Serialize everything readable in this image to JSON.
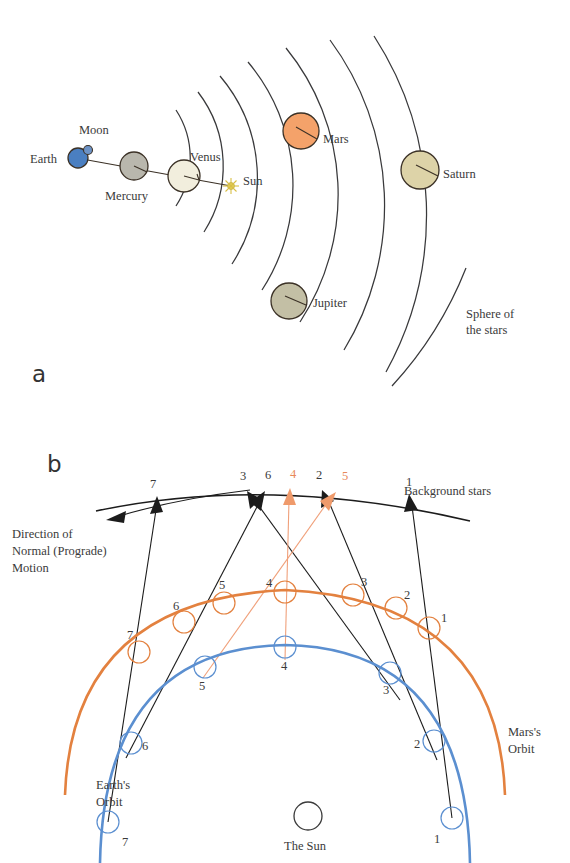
{
  "figure": {
    "panels": [
      {
        "letter": "a",
        "caption_x": 32,
        "caption_y": 382
      },
      {
        "letter": "b",
        "caption_x": 47,
        "caption_y": 464
      }
    ]
  },
  "panel_a": {
    "title_hidden": "Geocentric (Ptolemaic) arrangement",
    "bodies": [
      {
        "name": "Earth",
        "label": "Earth",
        "color": "#4a7fc1",
        "r": 10,
        "cx": 78,
        "cy": 158,
        "label_x": 30,
        "label_y": 162,
        "anchor": "start"
      },
      {
        "name": "Moon",
        "label": "Moon",
        "color": "#6d93c6",
        "r": 4,
        "cx": 88,
        "cy": 150,
        "label_x": 79,
        "label_y": 133,
        "anchor": "start"
      },
      {
        "name": "Mercury",
        "label": "Mercury",
        "color": "#b9b7ad",
        "r": 14,
        "cx": 134,
        "cy": 166,
        "label_x": 105,
        "label_y": 200,
        "anchor": "start"
      },
      {
        "name": "Venus",
        "label": "Venus",
        "color": "#f2eedd",
        "r": 16,
        "cx": 184,
        "cy": 176,
        "label_x": 190,
        "label_y": 161,
        "anchor": "start"
      },
      {
        "name": "Sun",
        "label": "Sun",
        "color": "#f2e06a",
        "r": 4,
        "cx": 231,
        "cy": 186,
        "label_x": 243,
        "label_y": 184,
        "anchor": "start"
      },
      {
        "name": "Mars",
        "label": "Mars",
        "color": "#f4a26a",
        "r": 18,
        "cx": 301,
        "cy": 131,
        "label_x": 323,
        "label_y": 142,
        "anchor": "start"
      },
      {
        "name": "Jupiter",
        "label": "Jupiter",
        "color": "#c3bfa5",
        "r": 18,
        "cx": 289,
        "cy": 301,
        "label_x": 312,
        "label_y": 306,
        "anchor": "start"
      },
      {
        "name": "Saturn",
        "label": "Saturn",
        "color": "#ddd3a8",
        "r": 19,
        "cx": 420,
        "cy": 170,
        "label_x": 443,
        "label_y": 177,
        "anchor": "start"
      }
    ],
    "sphere_of_stars": {
      "line1": "Sphere of",
      "line2": "the stars",
      "x": 466,
      "y": 318
    },
    "colors": {
      "earth": "#4a7fc1",
      "mars": "#f4a26a",
      "saturn": "#ddd3a8",
      "jupiter": "#c3bfa5",
      "mercury": "#b9b7ad",
      "venus": "#f2eedd",
      "sun": "#f2e06a",
      "orbit_line": "#39393b"
    }
  },
  "panel_b": {
    "background_stars_label": "Background stars",
    "background_stars_label_pos": {
      "x": 404,
      "y": 494
    },
    "direction_label": {
      "line1": "Direction of",
      "line2": "Normal (Prograde)",
      "line3": "Motion",
      "x": 12,
      "y": 538
    },
    "earth_orbit_label": {
      "line1": "Earth's",
      "line2": "Orbit",
      "x": 96,
      "y": 789
    },
    "mars_orbit_label": {
      "line1": "Mars's",
      "line2": "Orbit",
      "x": 508,
      "y": 736
    },
    "sun_label": {
      "text": "The Sun",
      "x": 286,
      "y": 847
    },
    "sky_marks": [
      {
        "n": "7",
        "x": 154,
        "y": 484,
        "color": "black"
      },
      {
        "n": "3",
        "x": 243,
        "y": 478,
        "color": "black"
      },
      {
        "n": "6",
        "x": 268,
        "y": 478,
        "color": "black"
      },
      {
        "n": "4",
        "x": 294,
        "y": 477,
        "color": "orange"
      },
      {
        "n": "2",
        "x": 320,
        "y": 478,
        "color": "black"
      },
      {
        "n": "5",
        "x": 345,
        "y": 478,
        "color": "orange"
      },
      {
        "n": "1",
        "x": 409,
        "y": 483,
        "color": "black"
      }
    ],
    "mars_positions": [
      {
        "n": "1",
        "cx": 429,
        "cy": 628,
        "label_x": 440,
        "label_y": 620
      },
      {
        "n": "2",
        "cx": 396,
        "cy": 608,
        "label_x": 403,
        "label_y": 598
      },
      {
        "n": "3",
        "cx": 353,
        "cy": 595,
        "label_x": 360,
        "label_y": 586
      },
      {
        "n": "4",
        "cx": 285,
        "cy": 592,
        "label_x": 268,
        "label_y": 585
      },
      {
        "n": "5",
        "cx": 224,
        "cy": 603,
        "label_x": 221,
        "label_y": 589
      },
      {
        "n": "6",
        "cx": 184,
        "cy": 622,
        "label_x": 175,
        "label_y": 608
      },
      {
        "n": "7",
        "cx": 139,
        "cy": 652,
        "label_x": 130,
        "label_y": 636
      },
      {
        "n": "",
        "cx": 0,
        "cy": 0,
        "label_x": 0,
        "label_y": 0
      }
    ],
    "earth_positions": [
      {
        "n": "1",
        "cx": 452,
        "cy": 818,
        "label_x": 436,
        "label_y": 840
      },
      {
        "n": "2",
        "cx": 434,
        "cy": 741,
        "label_x": 415,
        "label_y": 746
      },
      {
        "n": "3",
        "cx": 390,
        "cy": 673,
        "label_x": 384,
        "label_y": 692
      },
      {
        "n": "4",
        "cx": 285,
        "cy": 647,
        "label_x": 281,
        "label_y": 668
      },
      {
        "n": "5",
        "cx": 205,
        "cy": 667,
        "label_x": 198,
        "label_y": 687
      },
      {
        "n": "6",
        "cx": 131,
        "cy": 743,
        "label_x": 139,
        "label_y": 749
      },
      {
        "n": "7",
        "cx": 108,
        "cy": 822,
        "label_x": 121,
        "label_y": 845
      }
    ],
    "sun": {
      "cx": 308,
      "cy": 816,
      "r": 14
    },
    "colors": {
      "earth_orbit": "#5b8fd0",
      "mars_orbit": "#e3813f",
      "sightline_black": "#1c1c1c",
      "sightline_orange": "#f0a07a",
      "stars_arc": "#1c1c1c"
    }
  }
}
